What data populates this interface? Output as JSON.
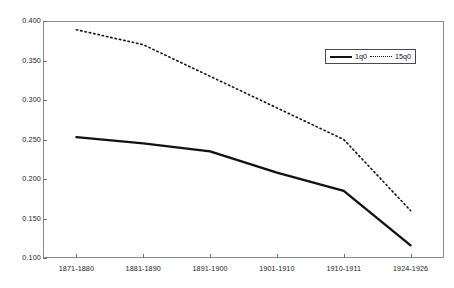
{
  "chart_data": {
    "type": "line",
    "title": "",
    "subtitle": "",
    "xlabel": "",
    "ylabel": "",
    "categories": [
      "1871-1880",
      "1881-1890",
      "1891-1900",
      "1901-1910",
      "1910-1911",
      "1924-1926"
    ],
    "series": [
      {
        "name": "1q0",
        "style": "solid",
        "color": "#111111",
        "values": [
          0.253,
          0.245,
          0.235,
          0.208,
          0.185,
          0.116
        ]
      },
      {
        "name": "15q0",
        "style": "dotted",
        "color": "#111111",
        "values": [
          0.389,
          0.37,
          0.33,
          0.29,
          0.25,
          0.16
        ]
      }
    ],
    "ylim": [
      0.1,
      0.4
    ],
    "y_ticks": [
      0.4,
      0.35,
      0.3,
      0.25,
      0.2,
      0.15,
      0.1
    ],
    "y_tick_labels": [
      "0.400",
      "0.350",
      "0.300",
      "0.250",
      "0.200",
      "0.150",
      "0.100"
    ],
    "grid": false,
    "legend_position": "top-right",
    "frame": true
  },
  "legend": {
    "entries": [
      {
        "label": "1q0",
        "style": "solid"
      },
      {
        "label": "15q0",
        "style": "dotted"
      }
    ]
  }
}
